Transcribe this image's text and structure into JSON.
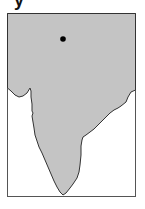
{
  "header": {
    "cropped_text_fragment": "y"
  },
  "map": {
    "region": "Indian subcontinent",
    "land_color": "#c4c4c4",
    "water_color": "#ffffff",
    "outline_color": "#333333",
    "frame_color": "#555555",
    "marker": {
      "type": "dot",
      "color": "#000000",
      "x": 63,
      "y": 39
    }
  }
}
